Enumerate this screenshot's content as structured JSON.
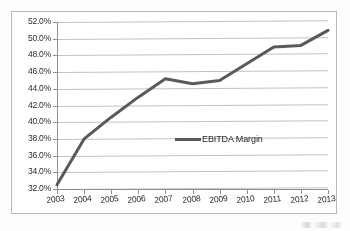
{
  "chart_data": {
    "type": "line",
    "title": "",
    "xlabel": "",
    "ylabel": "",
    "categories": [
      "2003",
      "2004",
      "2005",
      "2006",
      "2007",
      "2008",
      "2009",
      "2010",
      "2011",
      "2012",
      "2013"
    ],
    "series": [
      {
        "name": "EBITDA Margin",
        "values": [
          32.5,
          38.0,
          40.6,
          43.0,
          45.2,
          44.6,
          45.0,
          47.0,
          49.0,
          49.2,
          51.0
        ],
        "color": "#5a5a5a"
      }
    ],
    "ylim": [
      32.0,
      52.0
    ],
    "ytick_step": 2.0,
    "ytick_labels": [
      "52.0%",
      "50.0%",
      "48.0%",
      "46.0%",
      "44.0%",
      "42.0%",
      "40.0%",
      "38.0%",
      "36.0%",
      "34.0%",
      "32.0%"
    ],
    "ytick_values": [
      52.0,
      50.0,
      48.0,
      46.0,
      44.0,
      42.0,
      40.0,
      38.0,
      36.0,
      34.0,
      32.0
    ],
    "value_suffix": "%",
    "grid": true,
    "grid_axis": "y",
    "legend": true,
    "legend_position": "center",
    "legend_entries": [
      "EBITDA Margin"
    ]
  },
  "colors": {
    "series_line": "#5a5a5a",
    "gridline": "#c2c2c2",
    "axis": "#8f8f8f",
    "frame_border": "#b9b9b9",
    "text": "#2b2b2b",
    "plot_background": "#ffffff",
    "page_background": "#fdfdfd"
  }
}
